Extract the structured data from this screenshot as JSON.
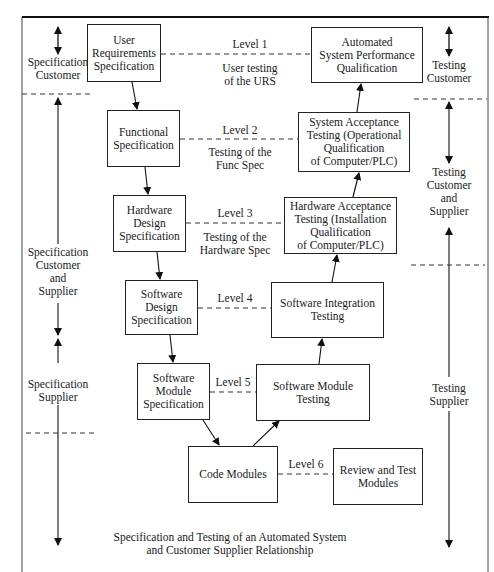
{
  "caption": {
    "line1": "Specification and Testing of an Automated System",
    "line2": "and Customer Supplier Relationship"
  },
  "left_side": {
    "spec_customer": [
      "Specification",
      "Customer"
    ],
    "spec_customer_supplier": [
      "Specification",
      "Customer",
      "and",
      "Supplier"
    ],
    "spec_supplier": [
      "Specification",
      "Supplier"
    ]
  },
  "right_side": {
    "testing_customer": [
      "Testing",
      "Customer"
    ],
    "testing_customer_supplier": [
      "Testing",
      "Customer",
      "and",
      "Supplier"
    ],
    "testing_supplier": [
      "Testing",
      "Supplier"
    ]
  },
  "spec_boxes": [
    {
      "lines": [
        "User",
        "Requirements",
        "Specification"
      ]
    },
    {
      "lines": [
        "Functional",
        "Specification"
      ]
    },
    {
      "lines": [
        "Hardware",
        "Design",
        "Specification"
      ]
    },
    {
      "lines": [
        "Software",
        "Design",
        "Specification"
      ]
    },
    {
      "lines": [
        "Software",
        "Module",
        "Specification"
      ]
    }
  ],
  "test_boxes": [
    {
      "lines": [
        "Automated",
        "System Performance",
        "Qualification"
      ]
    },
    {
      "lines": [
        "System Acceptance",
        "Testing (Operational",
        "Qualification",
        "of Computer/PLC)"
      ]
    },
    {
      "lines": [
        "Hardware Acceptance",
        "Testing (Installation",
        "Qualification",
        "of Computer/PLC)"
      ]
    },
    {
      "lines": [
        "Software Integration",
        "Testing"
      ]
    },
    {
      "lines": [
        "Software Module",
        "Testing"
      ]
    }
  ],
  "code_box": {
    "lines": [
      "Code Modules"
    ]
  },
  "review_box": {
    "lines": [
      "Review and Test",
      "Modules"
    ]
  },
  "levels": [
    {
      "label": "Level 1",
      "note": [
        "User testing",
        "of the URS"
      ]
    },
    {
      "label": "Level 2",
      "note": [
        "Testing of the",
        "Func Spec"
      ]
    },
    {
      "label": "Level 3",
      "note": [
        "Testing of the",
        "Hardware Spec"
      ]
    },
    {
      "label": "Level 4",
      "note": []
    },
    {
      "label": "Level 5",
      "note": []
    },
    {
      "label": "Level 6",
      "note": []
    }
  ]
}
